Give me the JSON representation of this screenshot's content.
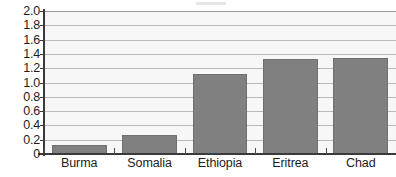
{
  "chart_data": {
    "type": "bar",
    "title": "",
    "subtitle": "",
    "xlabel": "",
    "ylabel": "",
    "categories": [
      "Burma",
      "Somalia",
      "Ethiopia",
      "Eritrea",
      "Chad"
    ],
    "values": [
      0.13,
      0.27,
      1.12,
      1.33,
      1.34
    ],
    "series": [
      {
        "name": "",
        "values": [
          0.13,
          0.27,
          1.12,
          1.33,
          1.34
        ]
      }
    ],
    "ylim": [
      0,
      2.0
    ],
    "ytick_step": 0.2,
    "ytick_labels": [
      "2.0",
      "1.8",
      "1.6",
      "1.4",
      "1.2",
      "1.0",
      "0.8",
      "0.6",
      "0.4",
      "0.2",
      "0"
    ],
    "ytick_values": [
      2.0,
      1.8,
      1.6,
      1.4,
      1.2,
      1.0,
      0.8,
      0.6,
      0.4,
      0.2,
      0
    ],
    "grid": true,
    "grid_axis": "y",
    "legend": false,
    "legend_position": "none",
    "annotations": [],
    "colors": {
      "bar_fill": "#808080",
      "bar_border": "#6f6f6f",
      "plot_background": "#f7f7f7",
      "gridline": "#b9b9b9",
      "axis_line": "#3a3a3a",
      "tick_label": "#1c1c1c",
      "page_background": "#ffffff"
    }
  }
}
